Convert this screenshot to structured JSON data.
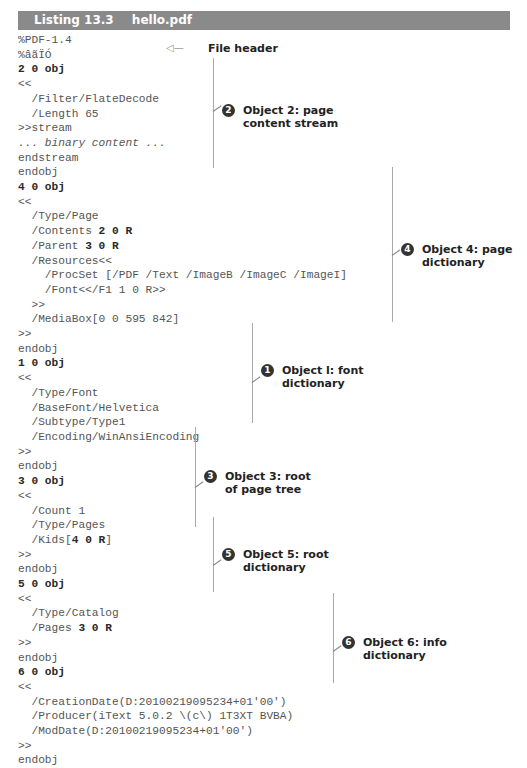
{
  "listing": {
    "label": "Listing 13.3",
    "filename": "hello.pdf"
  },
  "code_lines": [
    {
      "text": "%PDF-1.4",
      "style": "normal"
    },
    {
      "text": "%âãÏÓ",
      "style": "normal"
    },
    {
      "text": "2 0 obj",
      "style": "bold"
    },
    {
      "text": "<<",
      "style": "normal"
    },
    {
      "text": "  /Filter/FlateDecode",
      "style": "normal"
    },
    {
      "text": "  /Length 65",
      "style": "normal"
    },
    {
      "text": ">>stream",
      "style": "normal"
    },
    {
      "text": "... binary content ...",
      "style": "italic"
    },
    {
      "text": "endstream",
      "style": "normal"
    },
    {
      "text": "endobj",
      "style": "normal"
    },
    {
      "text": "4 0 obj",
      "style": "bold"
    },
    {
      "text": "<<",
      "style": "normal"
    },
    {
      "text": "  /Type/Page",
      "style": "normal"
    },
    {
      "text": "  /Contents ",
      "style": "normal",
      "bold_suffix": "2 0 R"
    },
    {
      "text": "  /Parent ",
      "style": "normal",
      "bold_suffix": "3 0 R"
    },
    {
      "text": "  /Resources<<",
      "style": "normal"
    },
    {
      "text": "    /ProcSet [/PDF /Text /ImageB /ImageC /ImageI]",
      "style": "normal"
    },
    {
      "text": "    /Font<</F1 1 0 R>>",
      "style": "normal"
    },
    {
      "text": "  >>",
      "style": "normal"
    },
    {
      "text": "  /MediaBox[0 0 595 842]",
      "style": "normal"
    },
    {
      "text": ">>",
      "style": "normal"
    },
    {
      "text": "endobj",
      "style": "normal"
    },
    {
      "text": "1 0 obj",
      "style": "bold"
    },
    {
      "text": "<<",
      "style": "normal"
    },
    {
      "text": "  /Type/Font",
      "style": "normal"
    },
    {
      "text": "  /BaseFont/Helvetica",
      "style": "normal"
    },
    {
      "text": "  /Subtype/Type1",
      "style": "normal"
    },
    {
      "text": "  /Encoding/WinAnsiEncoding",
      "style": "normal"
    },
    {
      "text": ">>",
      "style": "normal"
    },
    {
      "text": "endobj",
      "style": "normal"
    },
    {
      "text": "3 0 obj",
      "style": "bold"
    },
    {
      "text": "<<",
      "style": "normal"
    },
    {
      "text": "  /Count 1",
      "style": "normal"
    },
    {
      "text": "  /Type/Pages",
      "style": "normal"
    },
    {
      "text": "  /Kids[",
      "style": "normal",
      "bold_suffix": "4 0 R",
      "tail": "]"
    },
    {
      "text": ">>",
      "style": "normal"
    },
    {
      "text": "endobj",
      "style": "normal"
    },
    {
      "text": "5 0 obj",
      "style": "bold"
    },
    {
      "text": "<<",
      "style": "normal"
    },
    {
      "text": "  /Type/Catalog",
      "style": "normal"
    },
    {
      "text": "  /Pages ",
      "style": "normal",
      "bold_suffix": "3 0 R"
    },
    {
      "text": ">>",
      "style": "normal"
    },
    {
      "text": "endobj",
      "style": "normal"
    },
    {
      "text": "6 0 obj",
      "style": "bold"
    },
    {
      "text": "<<",
      "style": "normal"
    },
    {
      "text": "  /CreationDate(D:20100219095234+01'00')",
      "style": "normal"
    },
    {
      "text": "  /Producer(iText 5.0.2 \\(c\\) 1T3XT BVBA)",
      "style": "normal"
    },
    {
      "text": "  /ModDate(D:20100219095234+01'00')",
      "style": "normal"
    },
    {
      "text": ">>",
      "style": "normal"
    },
    {
      "text": "endobj",
      "style": "normal"
    }
  ],
  "annotations": {
    "file_header": {
      "arrow": "◁—",
      "text": "File header"
    },
    "obj2": {
      "number": "2",
      "text": "Object 2: page\ncontent stream"
    },
    "obj4": {
      "number": "4",
      "text": "Object 4: page\ndictionary"
    },
    "obj1": {
      "number": "1",
      "text": "Object l: font\ndictionary"
    },
    "obj3": {
      "number": "3",
      "text": "Object 3: root\nof page tree"
    },
    "obj5": {
      "number": "5",
      "text": "Object 5: root\ndictionary"
    },
    "obj6": {
      "number": "6",
      "text": "Object 6: info\ndictionary"
    }
  },
  "colors": {
    "header_bg": "#8a8a8a",
    "header_text": "#ffffff",
    "code_text": "#555555",
    "bullet_bg": "#333333"
  }
}
